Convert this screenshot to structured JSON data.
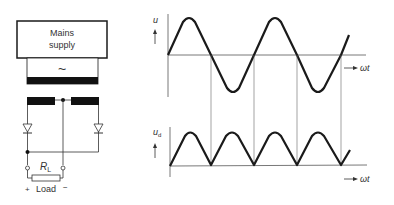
{
  "circuit": {
    "supply_label_line1": "Mains",
    "supply_label_line2": "supply",
    "ac_symbol": "~",
    "resistor_label_main": "R",
    "resistor_label_sub": "L",
    "load_plus": "+",
    "load_label": "Load",
    "load_minus": "−"
  },
  "waveforms": {
    "upper": {
      "ylabel": "u",
      "xlabel": "ωt",
      "description": "AC input sine voltage"
    },
    "lower": {
      "ylabel_main": "u",
      "ylabel_sub": "d",
      "xlabel": "ωt",
      "description": "Full-wave rectified output voltage"
    }
  },
  "colors": {
    "line": "#1a1a1a",
    "thin_line": "#555555",
    "background": "#ffffff"
  }
}
